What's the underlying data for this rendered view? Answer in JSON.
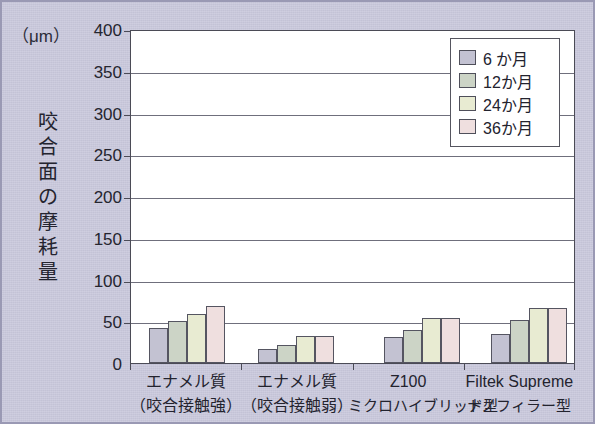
{
  "chart_data": {
    "type": "bar",
    "title": "",
    "subtitle": "",
    "unit_label": "（μm）",
    "ylabel": "咬合面の摩耗量",
    "ylabel_chars": [
      "咬",
      "合",
      "面",
      "の",
      "摩",
      "耗",
      "量"
    ],
    "xlabel": "",
    "ylim": [
      0,
      400
    ],
    "ytick_step": 50,
    "yticks": [
      0,
      50,
      100,
      150,
      200,
      250,
      300,
      350,
      400
    ],
    "ytick_labels": [
      "0",
      "50",
      "100",
      "150",
      "200",
      "250",
      "300",
      "350",
      "400"
    ],
    "grid": true,
    "grid_axis": "y",
    "legend_position": "top-right",
    "categories": [
      "エナメル質（咬合接触強）",
      "エナメル質（咬合接触弱）",
      "Z100 ミクロハイブリッド型",
      "Filtek Supreme ナノフィラー型"
    ],
    "category_lines": [
      [
        "エナメル質",
        "（咬合接触強）"
      ],
      [
        "エナメル質",
        "（咬合接触弱）"
      ],
      [
        "Z100",
        "ミクロハイブリッド型"
      ],
      [
        "Filtek Supreme",
        "ナノフィラー型"
      ]
    ],
    "series": [
      {
        "name": "6 か月",
        "color": "#c3c2d2",
        "values": [
          42,
          17,
          31,
          35
        ]
      },
      {
        "name": "12か月",
        "color": "#ccd4c6",
        "values": [
          50,
          21,
          39,
          51
        ]
      },
      {
        "name": "24か月",
        "color": "#e8ebd2",
        "values": [
          59,
          32,
          54,
          66
        ]
      },
      {
        "name": "36か月",
        "color": "#efdfdf",
        "values": [
          68,
          32,
          54,
          66
        ]
      }
    ]
  },
  "legend": {
    "items": [
      {
        "label": "6 か月",
        "color": "#c3c2d2"
      },
      {
        "label": "12か月",
        "color": "#ccd4c6"
      },
      {
        "label": "24か月",
        "color": "#e8ebd2"
      },
      {
        "label": "36か月",
        "color": "#efdfdf"
      }
    ]
  },
  "colors": {
    "background": "#c9c8dc",
    "plot_background": "#ffffff",
    "axis": "#4b4b56",
    "gridline": "#6f6f7c",
    "text": "#23232e",
    "bar_border": "#555561"
  }
}
